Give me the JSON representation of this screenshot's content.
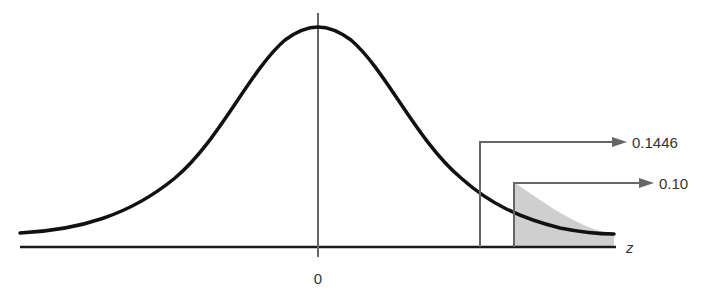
{
  "diagram": {
    "type": "standard-normal-distribution",
    "axis": {
      "variable_label": "z",
      "center_tick_label": "0"
    },
    "annotations": [
      {
        "name": "ordinate-at-z",
        "label": "0.1446",
        "points_to": "height of curve at vertical line"
      },
      {
        "name": "tail-area",
        "label": "0.10",
        "points_to": "shaded right-tail area"
      }
    ],
    "shaded_region": {
      "side": "right-tail",
      "area": "0.10"
    },
    "colors": {
      "curve": "#111111",
      "axis": "#1a1a1a",
      "guide_lines": "#666666",
      "shade": "#cfcfcf",
      "text": "#333333"
    }
  }
}
